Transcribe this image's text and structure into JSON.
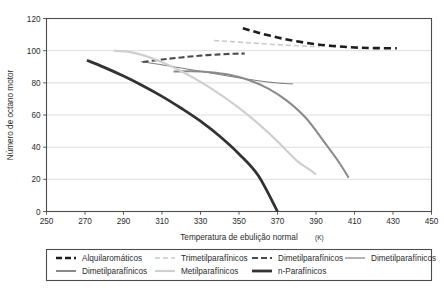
{
  "chart_data": {
    "type": "line",
    "title": "",
    "xlabel": "Temperatura de ebulição normal (K)",
    "xlabel_main": "Temperatura de ebulição normal",
    "xlabel_unit": "(K)",
    "ylabel": "Número de octano motor",
    "xlim": [
      250,
      450
    ],
    "ylim": [
      0,
      120
    ],
    "xticks": [
      250,
      270,
      290,
      310,
      330,
      350,
      370,
      390,
      410,
      430,
      450
    ],
    "yticks": [
      0,
      20,
      40,
      60,
      80,
      100,
      120
    ],
    "grid": "horizontal",
    "legend_position": "bottom",
    "series": [
      {
        "name": "Alquilaromáticos",
        "style": "dashed",
        "color": "#1c1c1c",
        "width": 2.6,
        "dash": "7,4",
        "x": [
          352,
          360,
          370,
          380,
          390,
          400,
          410,
          420,
          432
        ],
        "y": [
          114.0,
          111.2,
          108.2,
          105.8,
          104.0,
          102.8,
          102.0,
          101.6,
          101.5
        ]
      },
      {
        "name": "Trimetilparafínicos",
        "style": "dashed",
        "color": "#c9c9c9",
        "width": 1.6,
        "dash": "5,3",
        "x": [
          337,
          345,
          355,
          365,
          375,
          385,
          392
        ],
        "y": [
          106.3,
          105.7,
          104.9,
          104.1,
          103.4,
          102.8,
          102.4
        ]
      },
      {
        "name": "Dimetilparafínicos",
        "style": "dashed",
        "color": "#4a4a4a",
        "width": 2.1,
        "dash": "6,3",
        "x": [
          300,
          310,
          320,
          330,
          340,
          348,
          353
        ],
        "y": [
          93.0,
          94.5,
          95.8,
          96.9,
          97.7,
          98.1,
          98.2
        ]
      },
      {
        "name": "Dimetilparafínicos",
        "style": "solid-thin",
        "color": "#555555",
        "width": 0.8,
        "dash": "",
        "x": [
          299,
          310,
          320,
          330,
          340,
          350,
          360,
          370,
          378
        ],
        "y": [
          93.2,
          91.2,
          89.2,
          87.2,
          85.1,
          83.1,
          81.3,
          79.9,
          79.3
        ]
      },
      {
        "name": "Dimetilparafínicos",
        "style": "solid",
        "color": "#8a8a8a",
        "width": 2.0,
        "dash": "",
        "x": [
          316,
          325,
          335,
          345,
          355,
          365,
          375,
          385,
          395,
          402,
          407
        ],
        "y": [
          87.0,
          87.2,
          86.6,
          85.0,
          81.8,
          76.6,
          68.8,
          57.8,
          42.0,
          30.5,
          21.0
        ]
      },
      {
        "name": "Metilparafínicos",
        "style": "solid",
        "color": "#cfcfcf",
        "width": 2.2,
        "dash": "",
        "x": [
          285,
          292,
          300,
          310,
          320,
          330,
          340,
          350,
          360,
          370,
          380,
          386,
          390
        ],
        "y": [
          100.0,
          99.4,
          97.2,
          92.8,
          87.2,
          80.6,
          73.0,
          64.4,
          54.6,
          43.6,
          31.6,
          26.6,
          23.0
        ]
      },
      {
        "name": "n-Parafínicos",
        "style": "solid",
        "color": "#333333",
        "width": 2.8,
        "dash": "",
        "x": [
          271,
          280,
          290,
          300,
          310,
          320,
          330,
          340,
          350,
          360,
          370
        ],
        "y": [
          94.0,
          89.6,
          84.2,
          78.2,
          71.6,
          64.2,
          56.2,
          46.8,
          35.8,
          22.4,
          0.0
        ]
      }
    ]
  },
  "legend": {
    "rows": [
      [
        {
          "label": "Alquilaromáticos",
          "color": "#1c1c1c",
          "dash": "6,3",
          "width": 2.6
        },
        {
          "label": "Trimetilparafínicos",
          "color": "#c9c9c9",
          "dash": "5,3",
          "width": 1.6
        },
        {
          "label": "Dimetilparafínicos",
          "color": "#4a4a4a",
          "dash": "6,3",
          "width": 2.1
        },
        {
          "label": "Dimetilparafínicos",
          "color": "#555555",
          "dash": "",
          "width": 0.9
        }
      ],
      [
        {
          "label": "Dimetilparafínicos",
          "color": "#8a8a8a",
          "dash": "",
          "width": 2.0
        },
        {
          "label": "Metilparafínicos",
          "color": "#cfcfcf",
          "dash": "",
          "width": 2.2
        },
        {
          "label": "n-Parafínicos",
          "color": "#333333",
          "dash": "",
          "width": 2.8
        }
      ]
    ]
  },
  "colors": {
    "axis": "#4d4d4d",
    "grid": "#d9d9d9",
    "text": "#2b2b2b",
    "legend_border": "#4d4d4d"
  }
}
